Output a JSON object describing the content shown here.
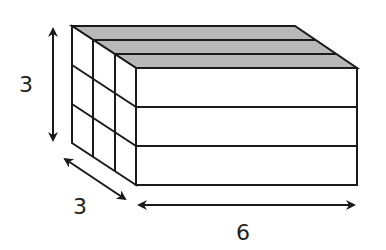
{
  "diagram": {
    "type": "rectangular-prism-unit-cubes",
    "dimensions": {
      "height": {
        "label": "3",
        "value": 3
      },
      "depth": {
        "label": "3",
        "value": 3
      },
      "length": {
        "label": "6",
        "value": 6
      }
    },
    "layers": 3,
    "colors": {
      "stroke": "#1a1a1a",
      "top_face": "#b8b8b8",
      "faces": "#ffffff",
      "label": "#222222"
    }
  }
}
